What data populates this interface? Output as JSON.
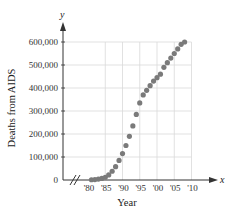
{
  "chart_data": {
    "type": "scatter",
    "title": "",
    "xlabel": "Year",
    "ylabel": "Deaths from AIDS",
    "x_axis_var": "x",
    "y_axis_var": "y",
    "xlim": [
      1980,
      2010
    ],
    "ylim": [
      0,
      600000
    ],
    "x_ticks": [
      "'80",
      "'85",
      "'90",
      "'95",
      "'00",
      "'05",
      "'10"
    ],
    "x_tick_values": [
      1980,
      1985,
      1990,
      1995,
      2000,
      2005,
      2010
    ],
    "y_ticks": [
      "0",
      "100,000",
      "200,000",
      "300,000",
      "400,000",
      "500,000",
      "600,000"
    ],
    "y_tick_values": [
      0,
      100000,
      200000,
      300000,
      400000,
      500000,
      600000
    ],
    "grid": true,
    "axis_break": true,
    "marker_color": "#7a7a7a",
    "grid_color": "#d9d9d9",
    "x": [
      1981,
      1982,
      1983,
      1984,
      1985,
      1986,
      1987,
      1988,
      1989,
      1990,
      1991,
      1992,
      1993,
      1994,
      1995,
      1996,
      1997,
      1998,
      1999,
      2000,
      2001,
      2002,
      2003,
      2004,
      2005,
      2006,
      2007,
      2008
    ],
    "values": [
      1000,
      2000,
      4000,
      7000,
      12000,
      22000,
      38000,
      58000,
      85000,
      115000,
      150000,
      190000,
      235000,
      285000,
      335000,
      370000,
      390000,
      410000,
      430000,
      445000,
      460000,
      490000,
      510000,
      530000,
      550000,
      570000,
      590000,
      600000
    ]
  }
}
